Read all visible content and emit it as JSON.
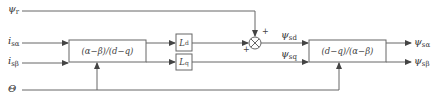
{
  "inputs": {
    "psi_r": {
      "symbol": "ψ",
      "sub": "r"
    },
    "i_s_alpha": {
      "symbol": "i",
      "sub": "sα"
    },
    "i_s_beta": {
      "symbol": "i",
      "sub": "sβ"
    },
    "theta": {
      "symbol": "Θ"
    }
  },
  "blocks": {
    "transform_ab_to_dq": "(α−β)/(d−q)",
    "Ld": {
      "symbol": "L",
      "sub": "d"
    },
    "Lq": {
      "symbol": "L",
      "sub": "q"
    },
    "transform_dq_to_ab": "(d−q)/(α−β)"
  },
  "summing_junction": {
    "sign_top": "+",
    "sign_left": "+"
  },
  "intermediate": {
    "psi_sd": {
      "symbol": "ψ",
      "sub": "sd"
    },
    "psi_sq": {
      "symbol": "ψ",
      "sub": "sq"
    }
  },
  "outputs": {
    "psi_s_alpha": {
      "symbol": "ψ",
      "sub": "sα"
    },
    "psi_s_beta": {
      "symbol": "ψ",
      "sub": "sβ"
    }
  },
  "colors": {
    "line": "#555555",
    "text": "#333333"
  }
}
